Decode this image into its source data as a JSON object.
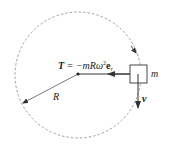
{
  "diagram": {
    "tension_label_bold": "T",
    "tension_label_eq": " = −mRω",
    "tension_label_sup": "2",
    "tension_label_vec": "e",
    "tension_label_sub": "r",
    "mass_label": "m",
    "velocity_label": "v",
    "radius_label": "R",
    "colors": {
      "line": "#333333",
      "circle": "#888888",
      "background": "#ffffff"
    }
  }
}
